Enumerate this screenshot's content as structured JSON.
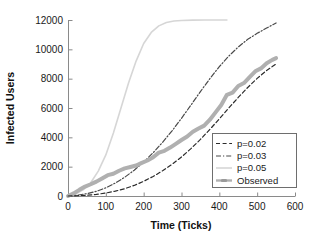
{
  "chart_data": {
    "type": "line",
    "title": "",
    "xlabel": "Time (Ticks)",
    "ylabel": "Infected Users",
    "xlim": [
      0,
      600
    ],
    "ylim": [
      0,
      12000
    ],
    "xticks": [
      0,
      100,
      200,
      300,
      400,
      500,
      600
    ],
    "xtick_labels": [
      "0",
      "100",
      "200",
      "300",
      "400",
      "500",
      "600"
    ],
    "yticks": [
      0,
      2000,
      4000,
      6000,
      8000,
      10000,
      12000
    ],
    "ytick_labels": [
      "0",
      "2000",
      "4000",
      "6000",
      "8000",
      "10000",
      "12000"
    ],
    "grid": false,
    "legend_position": "lower right",
    "series": [
      {
        "name": "p=0.02",
        "style": "dashed",
        "color": "#2b2b2b",
        "width": 1.2,
        "x": [
          0,
          25,
          50,
          75,
          100,
          125,
          150,
          175,
          200,
          225,
          250,
          275,
          300,
          325,
          350,
          375,
          400,
          425,
          450,
          475,
          500,
          525,
          550
        ],
        "y": [
          0,
          20,
          55,
          110,
          200,
          330,
          500,
          720,
          1000,
          1330,
          1720,
          2160,
          2660,
          3230,
          3860,
          4540,
          5260,
          6000,
          6720,
          7400,
          8020,
          8560,
          9000
        ]
      },
      {
        "name": "p=0.03",
        "style": "dashdot",
        "color": "#4a4a4a",
        "width": 1.2,
        "x": [
          0,
          25,
          50,
          75,
          100,
          125,
          150,
          175,
          200,
          225,
          250,
          275,
          300,
          325,
          350,
          375,
          400,
          425,
          450,
          475,
          500,
          525,
          550
        ],
        "y": [
          0,
          60,
          160,
          320,
          560,
          880,
          1280,
          1760,
          2320,
          2950,
          3660,
          4440,
          5300,
          6200,
          7120,
          8000,
          8820,
          9540,
          10160,
          10680,
          11090,
          11450,
          11800
        ]
      },
      {
        "name": "p=0.05",
        "style": "solid",
        "color": "#d6d6d6",
        "width": 1.6,
        "x": [
          0,
          20,
          40,
          60,
          80,
          100,
          120,
          140,
          160,
          180,
          200,
          220,
          240,
          260,
          280,
          300,
          330,
          360,
          390,
          420
        ],
        "y": [
          0,
          140,
          420,
          900,
          1700,
          2800,
          4300,
          6000,
          7700,
          9200,
          10400,
          11150,
          11600,
          11830,
          11930,
          11970,
          11990,
          12000,
          12000,
          12000
        ]
      },
      {
        "name": "Observed",
        "style": "solid-thick-marker",
        "color": "#b0b0b0",
        "width": 4.0,
        "x": [
          0,
          15,
          30,
          45,
          60,
          75,
          90,
          105,
          120,
          135,
          150,
          165,
          180,
          195,
          210,
          225,
          240,
          255,
          270,
          285,
          300,
          315,
          330,
          345,
          360,
          375,
          390,
          405,
          420,
          435,
          450,
          465,
          480,
          495,
          510,
          525,
          540,
          550
        ],
        "y": [
          0,
          180,
          420,
          640,
          800,
          980,
          1200,
          1420,
          1520,
          1720,
          1880,
          1980,
          2080,
          2260,
          2420,
          2640,
          2960,
          3080,
          3300,
          3560,
          3820,
          4060,
          4380,
          4600,
          4800,
          5200,
          5700,
          6200,
          6900,
          7050,
          7500,
          7700,
          8100,
          8500,
          8700,
          9050,
          9280,
          9400
        ]
      }
    ]
  },
  "legend": {
    "entries": [
      {
        "label": "p=0.02"
      },
      {
        "label": "p=0.03"
      },
      {
        "label": "p=0.05"
      },
      {
        "label": "Observed"
      }
    ]
  }
}
